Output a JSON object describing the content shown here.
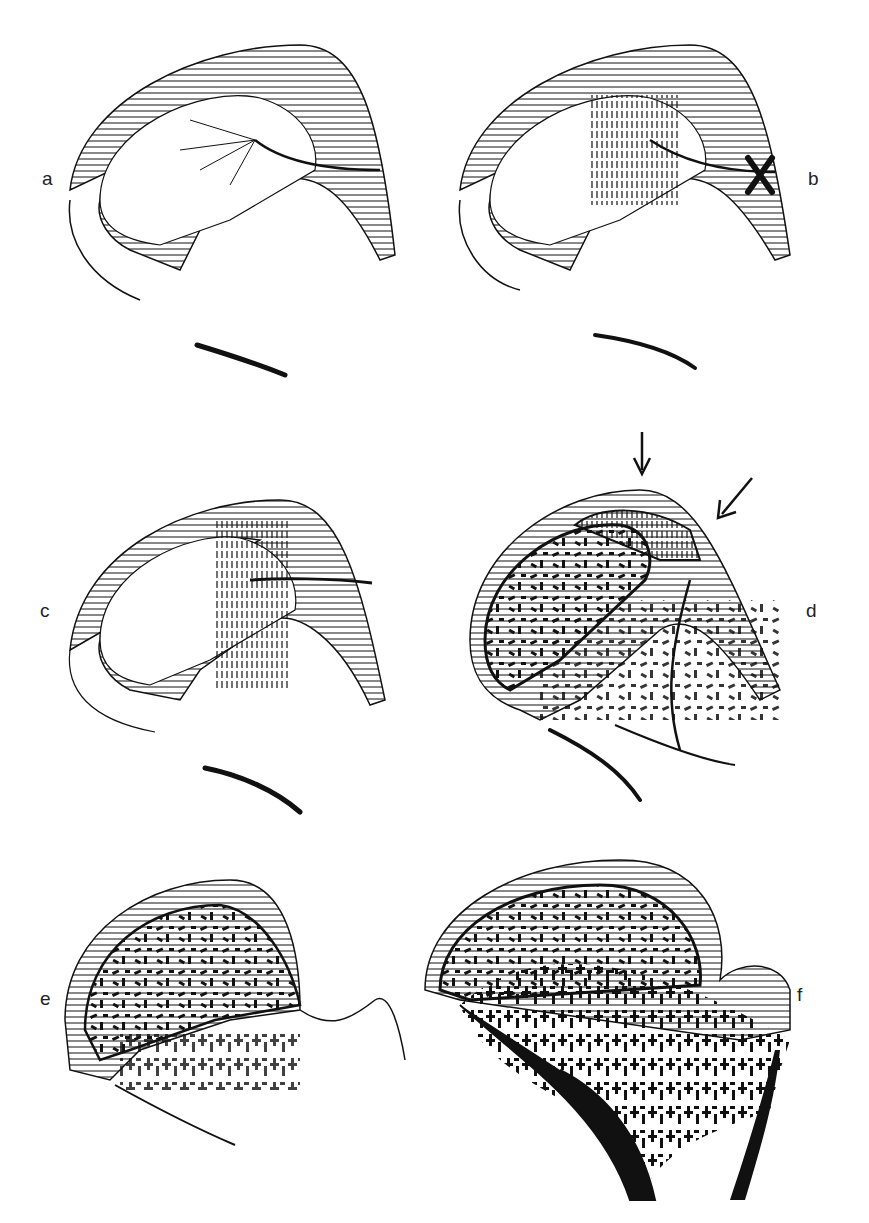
{
  "figure": {
    "panels": [
      {
        "id": "a",
        "label": "a",
        "description": "Femoral head outline with cartilage hatching, vessel branching into epiphysis"
      },
      {
        "id": "b",
        "label": "b",
        "description": "Vessel ligated (X mark), vertical hatching zone of necrosis"
      },
      {
        "id": "c",
        "label": "c",
        "description": "Partial necrosis with vertical-hatched region and vessel"
      },
      {
        "id": "d",
        "label": "d",
        "description": "Revascularization with speckled bone, two arrows pointing at surface"
      },
      {
        "id": "e",
        "label": "e",
        "description": "Remodelled epiphysis with dense trabecular pattern"
      },
      {
        "id": "f",
        "label": "f",
        "description": "Mature femoral head with trabecular bone and thick cortex"
      }
    ],
    "marks": {
      "ligature_symbol": "X",
      "arrow_count_panel_d": 2
    },
    "colors": {
      "ink": "#111111",
      "background": "#ffffff"
    }
  }
}
